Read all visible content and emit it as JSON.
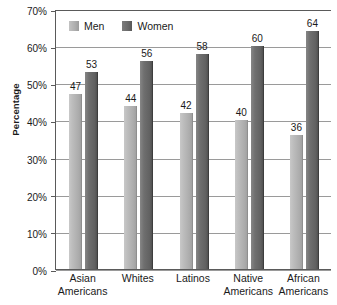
{
  "chart_data": {
    "type": "bar",
    "title": "",
    "xlabel": "",
    "ylabel": "Percentage",
    "ylim": [
      0,
      70
    ],
    "ytick_values": [
      0,
      10,
      20,
      30,
      40,
      50,
      60,
      70
    ],
    "ytick_labels": [
      "0%",
      "10%",
      "20%",
      "30%",
      "40%",
      "50%",
      "60%",
      "70%"
    ],
    "grid": true,
    "legend_position": "top-left",
    "categories": [
      {
        "line1": "Asian",
        "line2": "Americans"
      },
      {
        "line1": "Whites",
        "line2": ""
      },
      {
        "line1": "Latinos",
        "line2": ""
      },
      {
        "line1": "Native",
        "line2": "Americans"
      },
      {
        "line1": "African",
        "line2": "Americans"
      }
    ],
    "series": [
      {
        "name": "Men",
        "color": "#b0b0b0",
        "values": [
          47,
          44,
          42,
          40,
          36
        ],
        "labels": [
          "47",
          "44",
          "42",
          "40",
          "36"
        ]
      },
      {
        "name": "Women",
        "color": "#666666",
        "values": [
          53,
          56,
          58,
          60,
          64
        ],
        "labels": [
          "53",
          "56",
          "58",
          "60",
          "64"
        ]
      }
    ]
  },
  "legend": {
    "items": [
      {
        "label": "Men",
        "swatch_class": "men"
      },
      {
        "label": "Women",
        "swatch_class": "women"
      }
    ]
  },
  "axes": {
    "y_title": "Percentage"
  }
}
